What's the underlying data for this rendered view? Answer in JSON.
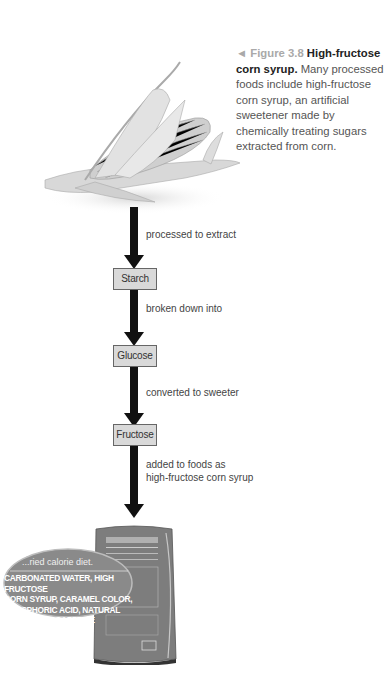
{
  "caption": {
    "figure_marker": "◄",
    "figure_label": "Figure 3.8",
    "title": "High-fructose corn syrup.",
    "body": "Many processed foods include high-fructose corn syrup, an artificial sweetener made by chemically treating sugars extracted from corn."
  },
  "illustrations": {
    "top": "corn-cob",
    "bottom": "soda-can"
  },
  "flow": {
    "steps": [
      {
        "label": "processed to extract"
      },
      {
        "box": "Starch"
      },
      {
        "label": "broken down into"
      },
      {
        "box": "Glucose"
      },
      {
        "label": "converted to sweeter"
      },
      {
        "box": "Fructose"
      },
      {
        "label_line1": "added to foods as",
        "label_line2": "high-fructose corn syrup"
      }
    ]
  },
  "label_callout": {
    "header": "...ried calorie diet.",
    "lines": [
      "CARBONATED WATER, HIGH FRUCTOSE",
      "CORN SYRUP, CARAMEL COLOR,",
      "PHOSPHORIC ACID, NATURAL",
      "FLAVORS, CAFFEINE"
    ]
  },
  "colors": {
    "arrow": "#111111",
    "box_fill": "#d9d9d9",
    "figure_label": "#a9a9a9",
    "can": "#7a7a7a"
  }
}
